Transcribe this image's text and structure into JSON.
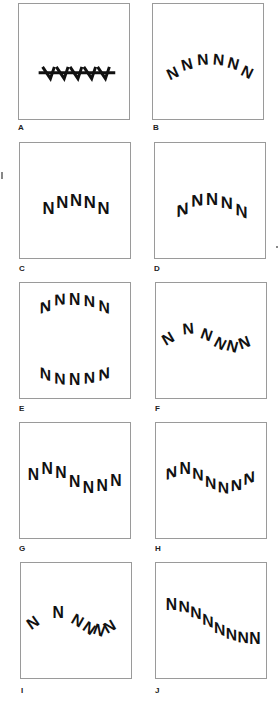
{
  "figure": {
    "panels": [
      {
        "id": "A",
        "label": "A",
        "content": "NNNNN",
        "transform": "letters overlapping along straight baseline (strikethrough-like)"
      },
      {
        "id": "B",
        "label": "B",
        "content": "NNNNNN",
        "transform": "letters rotated along upward arc"
      },
      {
        "id": "C",
        "label": "C",
        "content": "NNNNN",
        "transform": "letters upright, offset vertically along arc"
      },
      {
        "id": "D",
        "label": "D",
        "content": "NNNNN",
        "transform": "letters skewed along upward arc"
      },
      {
        "id": "E",
        "label": "E",
        "content_top": "NNNNN",
        "content_bottom": "NNNNN",
        "transform": "skewed along upward arc (top) and downward arc (bottom)"
      },
      {
        "id": "F",
        "label": "F",
        "content": "NNNNNN",
        "transform": "letters rotated along wave, compressed at end"
      },
      {
        "id": "G",
        "label": "G",
        "content": "NNNNNNN",
        "transform": "letters upright, offset vertically along wave"
      },
      {
        "id": "H",
        "label": "H",
        "content": "NNNNNNN",
        "transform": "letters skewed along wave"
      },
      {
        "id": "I",
        "label": "I",
        "content": "NNNNNN",
        "transform": "letters rotated along wave, overlapping at end"
      },
      {
        "id": "J",
        "label": "J",
        "content": "NNNNNNNN",
        "transform": "letters skewed along descending diagonal"
      }
    ]
  },
  "colors": {
    "ink": "#111111",
    "border": "#9a9a9a",
    "background": "#ffffff"
  }
}
